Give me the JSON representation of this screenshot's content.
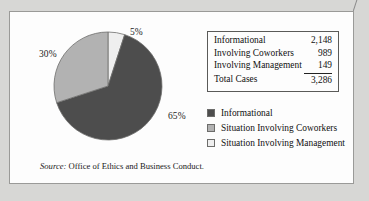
{
  "figure": {
    "source_keyword": "Source:",
    "source_text": " Office of Ethics and Business Conduct."
  },
  "table": {
    "rows": [
      {
        "label": "Informational",
        "value": "2,148",
        "rule_above": false
      },
      {
        "label": "Involving Coworkers",
        "value": "989",
        "rule_above": false
      },
      {
        "label": "Involving Management",
        "value": "149",
        "rule_above": false
      },
      {
        "label": "Total Cases",
        "value": "3,286",
        "rule_above": true
      }
    ]
  },
  "legend": {
    "items": [
      {
        "label": "Informational",
        "color": "#4d4d4d"
      },
      {
        "label": "Situation Involving Coworkers",
        "color": "#b2b2b2"
      },
      {
        "label": "Situation Involving Management",
        "color": "#efefef"
      }
    ]
  },
  "chart_data": {
    "type": "pie",
    "title": "",
    "categories": [
      "Informational",
      "Situation Involving Coworkers",
      "Situation Involving Management"
    ],
    "values": [
      65,
      30,
      5
    ],
    "value_unit": "percent",
    "counts": [
      2148,
      989,
      149
    ],
    "total_count": 3286,
    "colors": [
      "#4d4d4d",
      "#b2b2b2",
      "#efefef"
    ],
    "start_angle_deg": 0,
    "direction": "clockwise",
    "slice_order_from_12oclock": [
      "Situation Involving Management",
      "Informational",
      "Situation Involving Coworkers"
    ],
    "data_labels": [
      "5%",
      "65%",
      "30%"
    ],
    "legend_position": "right",
    "grid": false,
    "labels": {
      "top": "5%",
      "left": "30%",
      "right": "65%"
    }
  }
}
